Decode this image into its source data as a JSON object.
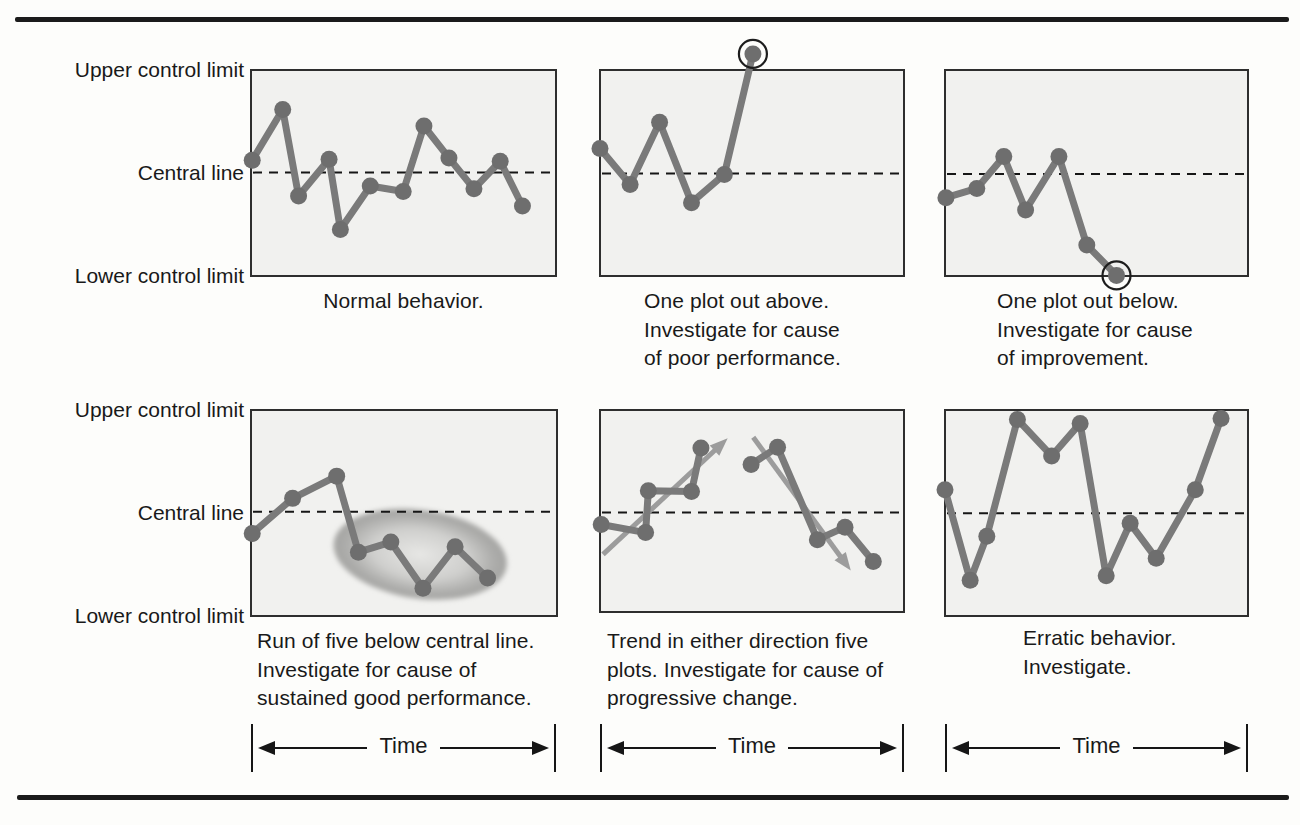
{
  "colors": {
    "data_line": "#7a7a7a",
    "data_point": "#6e6e6e",
    "trend_arrow": "#9c9c9c",
    "panel_bg": "#f1f1ef",
    "panel_border": "#2e2e2e",
    "central_dash": "#161616",
    "outlier_ring": "#1d1d1d",
    "rule": "#1b1b1b",
    "text": "#191919"
  },
  "row_labels": {
    "upper": "Upper control limit",
    "central": "Central line",
    "lower": "Lower control limit"
  },
  "time_axis_label": "Time",
  "panels": [
    {
      "name": "normal-behavior",
      "caption": "Normal behavior.",
      "box": {
        "x": 251,
        "y": 70,
        "w": 305,
        "h": 206
      },
      "central": 0.498,
      "series": [
        [
          [
            0.004,
            0.438
          ],
          [
            0.104,
            0.192
          ],
          [
            0.156,
            0.612
          ],
          [
            0.256,
            0.433
          ],
          [
            0.293,
            0.774
          ],
          [
            0.391,
            0.563
          ],
          [
            0.499,
            0.59
          ],
          [
            0.567,
            0.272
          ],
          [
            0.649,
            0.427
          ],
          [
            0.731,
            0.577
          ],
          [
            0.817,
            0.443
          ],
          [
            0.89,
            0.66
          ]
        ]
      ]
    },
    {
      "name": "one-plot-out-above",
      "caption": "One plot out above.\nInvestigate for cause\nof poor performance.",
      "box": {
        "x": 600,
        "y": 70,
        "w": 304,
        "h": 206
      },
      "central": 0.502,
      "series": [
        [
          [
            0.0,
            0.381
          ],
          [
            0.099,
            0.556
          ],
          [
            0.196,
            0.254
          ],
          [
            0.301,
            0.644
          ],
          [
            0.409,
            0.507
          ],
          [
            0.503,
            -0.078
          ]
        ]
      ],
      "circled": {
        "series": 0,
        "point": 5
      }
    },
    {
      "name": "one-plot-out-below",
      "caption": "One plot out below.\nInvestigate for cause\nof improvement.",
      "box": {
        "x": 945,
        "y": 70,
        "w": 303,
        "h": 206
      },
      "central": 0.505,
      "series": [
        [
          [
            0.003,
            0.62
          ],
          [
            0.105,
            0.575
          ],
          [
            0.194,
            0.42
          ],
          [
            0.266,
            0.68
          ],
          [
            0.376,
            0.42
          ],
          [
            0.468,
            0.85
          ],
          [
            0.566,
            0.997
          ]
        ]
      ],
      "circled": {
        "series": 0,
        "point": 6
      }
    },
    {
      "name": "run-of-five-below-central-line",
      "caption": "Run of five below central line.\nInvestigate for cause of\nsustained good performance.",
      "box": {
        "x": 251,
        "y": 410,
        "w": 306,
        "h": 206
      },
      "central": 0.494,
      "series": [
        [
          [
            0.004,
            0.599
          ],
          [
            0.136,
            0.429
          ],
          [
            0.28,
            0.321
          ],
          [
            0.351,
            0.69
          ],
          [
            0.457,
            0.641
          ],
          [
            0.562,
            0.865
          ],
          [
            0.667,
            0.664
          ],
          [
            0.773,
            0.816
          ]
        ]
      ],
      "ellipse": {
        "cx": 0.553,
        "cy": 0.7,
        "rx": 0.285,
        "ry": 0.215,
        "rotate": 8
      }
    },
    {
      "name": "trend-in-either-direction",
      "caption": "Trend in either direction five\nplots. Investigate for cause of\nprogressive change.",
      "box": {
        "x": 600,
        "y": 410,
        "w": 304,
        "h": 202
      },
      "central": 0.508,
      "series": [
        [
          [
            0.004,
            0.567
          ],
          [
            0.15,
            0.607
          ],
          [
            0.159,
            0.4
          ],
          [
            0.301,
            0.403
          ],
          [
            0.332,
            0.188
          ]
        ],
        [
          [
            0.497,
            0.27
          ],
          [
            0.584,
            0.184
          ],
          [
            0.715,
            0.642
          ],
          [
            0.806,
            0.58
          ],
          [
            0.899,
            0.75
          ]
        ]
      ],
      "arrows": [
        {
          "from": [
            0.01,
            0.715
          ],
          "to": [
            0.42,
            0.14
          ]
        },
        {
          "from": [
            0.504,
            0.135
          ],
          "to": [
            0.825,
            0.795
          ]
        }
      ]
    },
    {
      "name": "erratic-behavior",
      "caption": "Erratic behavior.\nInvestigate.",
      "box": {
        "x": 945,
        "y": 410,
        "w": 303,
        "h": 206
      },
      "central": 0.501,
      "series": [
        [
          [
            0.0,
            0.387
          ],
          [
            0.083,
            0.826
          ],
          [
            0.138,
            0.613
          ],
          [
            0.239,
            0.046
          ],
          [
            0.352,
            0.223
          ],
          [
            0.446,
            0.065
          ],
          [
            0.532,
            0.805
          ],
          [
            0.611,
            0.55
          ],
          [
            0.697,
            0.72
          ],
          [
            0.826,
            0.387
          ],
          [
            0.911,
            0.041
          ]
        ]
      ]
    }
  ]
}
